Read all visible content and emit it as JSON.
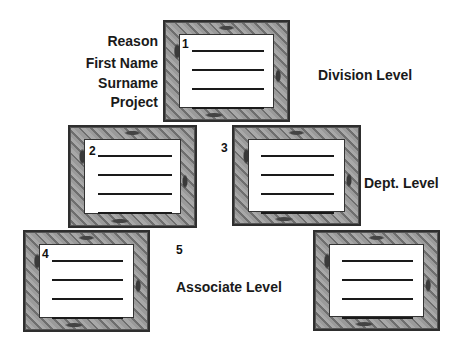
{
  "field_labels": [
    "Reason",
    "First Name",
    "Surname",
    "Project"
  ],
  "levels": {
    "division": "Division Level",
    "dept": "Dept. Level",
    "associate": "Associate Level"
  },
  "frames": [
    {
      "number": "1"
    },
    {
      "number": "2"
    },
    {
      "number": "3"
    },
    {
      "number": "4"
    },
    {
      "number": "5"
    }
  ]
}
